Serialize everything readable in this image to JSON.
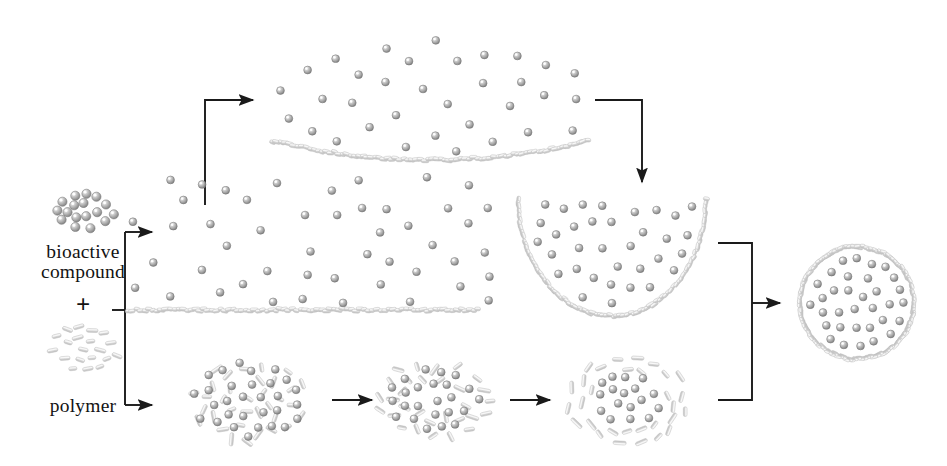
{
  "figure": {
    "domain": "Diagram",
    "background_color": "#ffffff",
    "width": 947,
    "height": 466
  },
  "palette": {
    "particle_fill": "#9a9a9a",
    "particle_stroke": "#6f6f6f",
    "particle_highlight": "#ffffff",
    "polymer_rod": "#d3d3d3",
    "polymer_rod_stroke": "#c2c2c2",
    "membrane": "#c8c8c8",
    "arrow": "#1a1a1a",
    "text": "#131313"
  },
  "labels": {
    "bioactive_line1": "bioactive",
    "bioactive_line2": "compound",
    "plus": "+",
    "polymer": "polymer"
  },
  "legend_clusters": {
    "bioactive_compound": {
      "name": "bioactive-compound-cluster",
      "kind": "spheres",
      "count": 21,
      "center": [
        86,
        212
      ],
      "radius": 30
    },
    "polymer": {
      "name": "polymer-cluster",
      "kind": "rods",
      "count": 26,
      "center": [
        86,
        347
      ],
      "radius": 34
    }
  },
  "stages": {
    "top_curved_film": {
      "name": "top-curved-film-stage",
      "description": "particles suspended above a concave polymer film",
      "particle_count": 36,
      "film": {
        "x_start": 273,
        "x_end": 588,
        "y_edge": 141,
        "y_center": 160
      }
    },
    "middle_flat_film": {
      "name": "middle-flat-film-stage",
      "description": "particles suspended above a flat polymer film",
      "particle_count": 48,
      "film": {
        "x_start": 128,
        "x_end": 478,
        "y": 310
      }
    },
    "bowl": {
      "name": "bowl-stage",
      "description": "polymer film curled into an open hemispherical bowl holding particles",
      "particle_count": 38,
      "bounds": {
        "x": 518,
        "y": 198,
        "width": 188,
        "height": 118
      }
    },
    "blob_1": {
      "name": "emulsion-blob-1",
      "description": "randomly dispersed particles and polymer rods",
      "center": [
        250,
        402
      ],
      "rx": 62,
      "ry": 43,
      "particle_count": 30,
      "rod_count": 34
    },
    "blob_2": {
      "name": "emulsion-blob-2",
      "description": "rods beginning to migrate outward",
      "center": [
        434,
        400
      ],
      "rx": 53,
      "ry": 38,
      "particle_count": 26,
      "rod_count": 30
    },
    "blob_3": {
      "name": "emulsion-blob-3",
      "description": "rods forming an outer shell around a particle core",
      "center": [
        628,
        400
      ],
      "rx": 56,
      "ry": 42,
      "particle_count": 34,
      "rod_count": 30
    },
    "final_capsule": {
      "name": "final-microcapsule",
      "description": "finished microcapsule: polymer shell enclosing the bioactive particles",
      "center": [
        857,
        303
      ],
      "rx": 57,
      "ry": 56,
      "particle_count": 40
    }
  },
  "connectors": [
    {
      "name": "split-bracket-left",
      "type": "bracket",
      "description": "splits bioactive compound plus polymer into upper and lower routes"
    },
    {
      "name": "arrow-to-top-film",
      "type": "elbow-arrow",
      "direction": "up-then-right"
    },
    {
      "name": "arrow-to-middle-film",
      "type": "straight-arrow",
      "direction": "right"
    },
    {
      "name": "arrow-to-bottom-blob",
      "type": "straight-arrow",
      "direction": "right"
    },
    {
      "name": "arrow-top-film-to-bowl",
      "type": "elbow-arrow",
      "direction": "right-then-down"
    },
    {
      "name": "arrow-blob1-to-blob2",
      "type": "straight-arrow",
      "direction": "right"
    },
    {
      "name": "arrow-blob2-to-blob3",
      "type": "straight-arrow",
      "direction": "right"
    },
    {
      "name": "merge-bracket-right",
      "type": "bracket",
      "description": "merges bowl route and blob route into the final capsule"
    },
    {
      "name": "arrow-to-final-capsule",
      "type": "straight-arrow",
      "direction": "right"
    }
  ]
}
